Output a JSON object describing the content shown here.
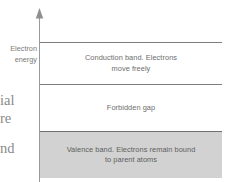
{
  "diagram": {
    "background_color": "#ffffff",
    "axis": {
      "name": "electron-energy-axis",
      "direction": "up",
      "line_color": "#9a9a9a",
      "caption_line_1": "Electron",
      "caption_line_2": "energy"
    },
    "rule_color": "#7d7d7d",
    "bands": [
      {
        "id": "conduction",
        "label": "Conduction band. Electrons move freely",
        "line_1": "Conduction band. Electrons",
        "line_2": "move freely",
        "fill": "none",
        "text_color": "#6c6c6c"
      },
      {
        "id": "forbidden",
        "label": "Forbidden gap",
        "line_1": "Forbidden gap",
        "line_2": "",
        "fill": "none",
        "text_color": "#6c6c6c"
      },
      {
        "id": "valence",
        "label": "Valence band. Electrons remain bound to parent atoms",
        "line_1": "Valence band. Electrons remain bound",
        "line_2": "to parent atoms",
        "fill": "#d2d2d2",
        "text_color": "#5e5e5e"
      }
    ]
  },
  "margin_fragments": {
    "fragment_1": "ial",
    "fragment_2": "re",
    "fragment_3": "nd"
  }
}
